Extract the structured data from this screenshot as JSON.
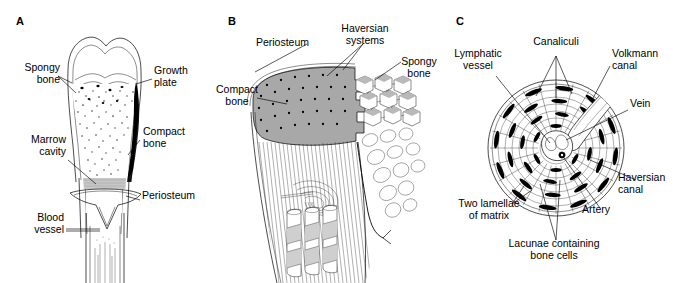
{
  "figure": {
    "background_color": "#ffffff",
    "ink_color": "#000000",
    "shade_color": "#a8a8a8"
  },
  "panels": [
    {
      "letter": "A",
      "name": "long-bone-longitudinal-section",
      "labels": [
        {
          "id": "spongy-bone",
          "text": "Spongy\nbone",
          "align": "right"
        },
        {
          "id": "growth-plate",
          "text": "Growth\nplate",
          "align": "left"
        },
        {
          "id": "marrow-cavity",
          "text": "Marrow\ncavity",
          "align": "right"
        },
        {
          "id": "compact-bone",
          "text": "Compact\nbone",
          "align": "left"
        },
        {
          "id": "periosteum",
          "text": "Periosteum",
          "align": "left"
        },
        {
          "id": "blood-vessel",
          "text": "Blood\nvessel",
          "align": "right"
        }
      ]
    },
    {
      "letter": "B",
      "name": "compact-and-spongy-bone-cutaway",
      "labels": [
        {
          "id": "periosteum",
          "text": "Periosteum",
          "align": "right"
        },
        {
          "id": "haversian-systems",
          "text": "Haversian\nsystems",
          "align": "center"
        },
        {
          "id": "spongy-bone",
          "text": "Spongy\nbone",
          "align": "center"
        },
        {
          "id": "compact-bone",
          "text": "Compact\nbone",
          "align": "center"
        }
      ]
    },
    {
      "letter": "C",
      "name": "haversian-system-cross-section",
      "labels": [
        {
          "id": "canaliculi",
          "text": "Canaliculi",
          "align": "center"
        },
        {
          "id": "lymphatic-vessel",
          "text": "Lymphatic\nvessel",
          "align": "center"
        },
        {
          "id": "volkmann-canal",
          "text": "Volkmann\ncanal",
          "align": "left"
        },
        {
          "id": "vein",
          "text": "Vein",
          "align": "left"
        },
        {
          "id": "haversian-canal",
          "text": "Haversian\ncanal",
          "align": "left"
        },
        {
          "id": "artery",
          "text": "Artery",
          "align": "left"
        },
        {
          "id": "two-lamellae",
          "text": "Two lamellae\nof matrix",
          "align": "center"
        },
        {
          "id": "lacunae",
          "text": "Lacunae containing\nbone cells",
          "align": "center"
        }
      ]
    }
  ]
}
